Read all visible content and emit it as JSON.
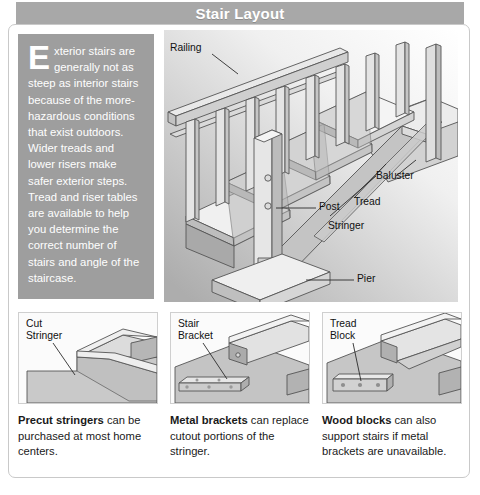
{
  "header": {
    "title": "Stair Layout"
  },
  "intro": {
    "dropcap": "E",
    "body": "xterior stairs are generally not as steep as interior stairs because of the more-hazardous conditions that exist outdoors. Wider treads and lower risers make safer exterior steps. Tread and riser tables are available to help you determine the correct number of stairs and angle of the staircase."
  },
  "diagram": {
    "name": "exterior-stair-isometric",
    "labels": [
      {
        "id": "railing",
        "text": "Railing"
      },
      {
        "id": "baluster",
        "text": "Baluster"
      },
      {
        "id": "tread",
        "text": "Tread"
      },
      {
        "id": "stringer",
        "text": "Stringer"
      },
      {
        "id": "post",
        "text": "Post"
      },
      {
        "id": "pier",
        "text": "Pier"
      }
    ]
  },
  "panels": [
    {
      "id": "cut-stringer",
      "art_label": "Cut\nStringer",
      "caption_bold": "Precut stringers",
      "caption_rest": " can be purchased at most home centers."
    },
    {
      "id": "stair-bracket",
      "art_label": "Stair\nBracket",
      "caption_bold": "Metal brackets",
      "caption_rest": " can replace cutout portions of the stringer."
    },
    {
      "id": "tread-block",
      "art_label": "Tread\nBlock",
      "caption_bold": "Wood blocks",
      "caption_rest": " can also support stairs if metal brackets are unavailable."
    }
  ],
  "colors": {
    "title_bar": "#a8a8a8",
    "intro_block": "#9e9e9e",
    "frame_border": "#c9c9c9",
    "text": "#1a1a1a",
    "wood_light": "#e8e8e8",
    "wood_mid": "#cfcfcf",
    "wood_dark": "#a9a9a9",
    "outline": "#555555"
  }
}
